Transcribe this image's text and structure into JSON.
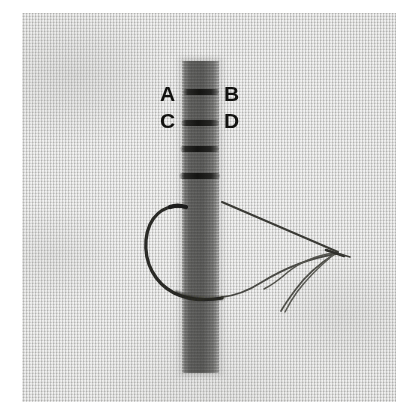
{
  "image": {
    "title": "Stitch instruction photograph",
    "description": "Close-up photograph of light woven fabric with a dark vertical tape strip stitched across, a curved needle and thread forming a loop",
    "background_color": "#ffffff",
    "fabric_color": "#d9d9d7",
    "strip_color": "#56564f",
    "thread_color": "#2b2b28",
    "label_color": "#121210"
  },
  "labels": [
    {
      "text": "A",
      "x": 160,
      "y": 83,
      "name": "label-a"
    },
    {
      "text": "B",
      "x": 224,
      "y": 83,
      "name": "label-b"
    },
    {
      "text": "C",
      "x": 160,
      "y": 110,
      "name": "label-c"
    },
    {
      "text": "D",
      "x": 224,
      "y": 110,
      "name": "label-d"
    }
  ],
  "strip": {
    "name": "dark-fabric-strip",
    "left": 182,
    "top": 61,
    "width": 37,
    "height": 312
  },
  "stitches": [
    {
      "left": 183,
      "top": 89,
      "width": 36,
      "name": "stitch-bar-1"
    },
    {
      "left": 181,
      "top": 120,
      "width": 38,
      "name": "stitch-bar-2"
    },
    {
      "left": 180,
      "top": 146,
      "width": 39,
      "name": "stitch-bar-3"
    },
    {
      "left": 179,
      "top": 173,
      "width": 41,
      "name": "stitch-bar-4"
    }
  ],
  "needle": {
    "name": "curved-needle",
    "tip_x": 186,
    "tip_y": 206,
    "description": "curved needle arcing left of the strip from upper tip down and around to the lower right"
  },
  "thread": {
    "name": "thread",
    "loop_description": "thread runs from needle eye at right, loops back left under the strip and terminates in two loose tails"
  }
}
